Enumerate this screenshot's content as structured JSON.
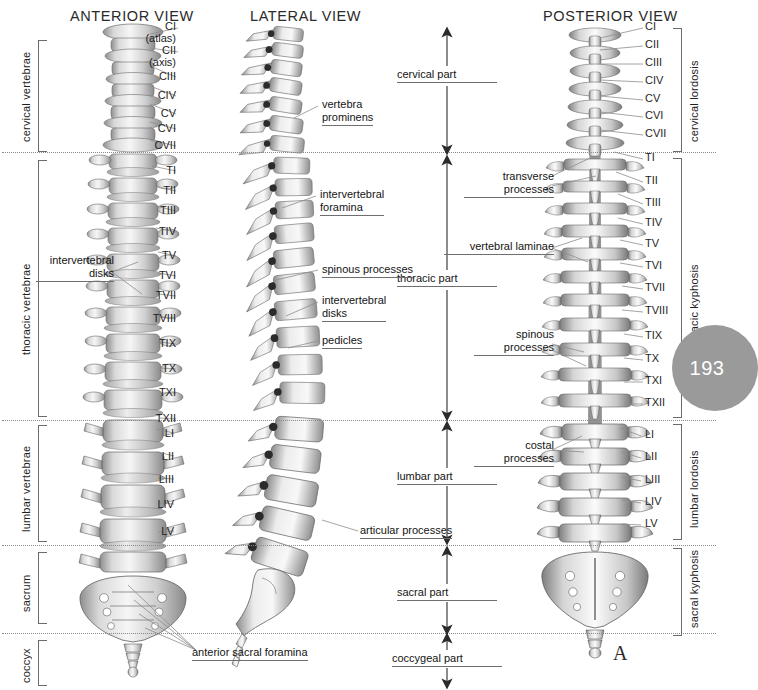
{
  "figure": {
    "figure_label": "A",
    "page_number": "193"
  },
  "headers": [
    {
      "name": "anterior",
      "text": "ANTERIOR VIEW",
      "x": 70,
      "y": 8
    },
    {
      "name": "lateral",
      "text": "LATERAL VIEW",
      "x": 250,
      "y": 8
    },
    {
      "name": "posterior",
      "text": "POSTERIOR VIEW",
      "x": 543,
      "y": 8
    }
  ],
  "left_brackets": [
    {
      "name": "cervical-vertebrae",
      "label": "cervical vertebrae",
      "y": 40,
      "h": 110
    },
    {
      "name": "thoracic-vertebrae",
      "label": "thoracic vertebrae",
      "y": 160,
      "h": 255
    },
    {
      "name": "lumbar-vertebrae",
      "label": "lumbar vertebrae",
      "y": 425,
      "h": 115
    },
    {
      "name": "sacrum",
      "label": "sacrum",
      "y": 552,
      "h": 70
    },
    {
      "name": "coccyx",
      "label": "coccyx",
      "y": 630,
      "h": 52
    }
  ],
  "right_brackets": [
    {
      "name": "cervical-lordosis",
      "label": "cervical lordosis",
      "y": 28,
      "h": 122
    },
    {
      "name": "thoracic-kyphosis",
      "label": "thoracic kyphosis",
      "y": 158,
      "h": 258
    },
    {
      "name": "lumbar-lordosis",
      "label": "lumbar lordosis",
      "y": 424,
      "h": 114
    },
    {
      "name": "sacral-kyphosis",
      "label": "sacral kyphosis",
      "y": 548,
      "h": 86
    }
  ],
  "anterior_labels": [
    {
      "name": "ci",
      "text": "CI",
      "y": 26
    },
    {
      "name": "atlas",
      "text": "(atlas)",
      "y": 38
    },
    {
      "name": "cii",
      "text": "CII",
      "y": 50
    },
    {
      "name": "axis",
      "text": "(axis)",
      "y": 62
    },
    {
      "name": "ciii",
      "text": "CIII",
      "y": 76
    },
    {
      "name": "civ",
      "text": "CIV",
      "y": 95
    },
    {
      "name": "cv",
      "text": "CV",
      "y": 113
    },
    {
      "name": "cvi",
      "text": "CVI",
      "y": 128
    },
    {
      "name": "cvii",
      "text": "CVII",
      "y": 145
    },
    {
      "name": "ti",
      "text": "TI",
      "y": 170
    },
    {
      "name": "tii",
      "text": "TII",
      "y": 190
    },
    {
      "name": "tiii",
      "text": "TIII",
      "y": 210
    },
    {
      "name": "tiv",
      "text": "TIV",
      "y": 231
    },
    {
      "name": "tv",
      "text": "TV",
      "y": 255
    },
    {
      "name": "tvi",
      "text": "TVI",
      "y": 275
    },
    {
      "name": "tvii",
      "text": "TVII",
      "y": 295
    },
    {
      "name": "tviii",
      "text": "TVIII",
      "y": 318
    },
    {
      "name": "tix",
      "text": "TIX",
      "y": 343
    },
    {
      "name": "tx",
      "text": "TX",
      "y": 368
    },
    {
      "name": "txi",
      "text": "TXI",
      "y": 392
    },
    {
      "name": "txii",
      "text": "TXII",
      "y": 418
    },
    {
      "name": "li",
      "text": "LI",
      "y": 432
    },
    {
      "name": "lii",
      "text": "LII",
      "y": 455
    },
    {
      "name": "liii",
      "text": "LIII",
      "y": 478
    },
    {
      "name": "liv",
      "text": "LIV",
      "y": 503
    },
    {
      "name": "lv",
      "text": "LV",
      "y": 530
    }
  ],
  "posterior_labels": [
    {
      "name": "ci",
      "text": "CI",
      "y": 26
    },
    {
      "name": "cii",
      "text": "CII",
      "y": 44
    },
    {
      "name": "ciii",
      "text": "CIII",
      "y": 62
    },
    {
      "name": "civ",
      "text": "CIV",
      "y": 80
    },
    {
      "name": "cv",
      "text": "CV",
      "y": 98
    },
    {
      "name": "cvi",
      "text": "CVI",
      "y": 115
    },
    {
      "name": "cvii",
      "text": "CVII",
      "y": 133
    },
    {
      "name": "ti",
      "text": "TI",
      "y": 157
    },
    {
      "name": "tii",
      "text": "TII",
      "y": 180
    },
    {
      "name": "tiii",
      "text": "TIII",
      "y": 202
    },
    {
      "name": "tiv",
      "text": "TIV",
      "y": 222
    },
    {
      "name": "tv",
      "text": "TV",
      "y": 243
    },
    {
      "name": "tvi",
      "text": "TVI",
      "y": 265
    },
    {
      "name": "tvii",
      "text": "TVII",
      "y": 287
    },
    {
      "name": "tviii",
      "text": "TVIII",
      "y": 310
    },
    {
      "name": "tix",
      "text": "TIX",
      "y": 335
    },
    {
      "name": "tx",
      "text": "TX",
      "y": 358
    },
    {
      "name": "txi",
      "text": "TXI",
      "y": 380
    },
    {
      "name": "txii",
      "text": "TXII",
      "y": 402
    },
    {
      "name": "li",
      "text": "LI",
      "y": 434
    },
    {
      "name": "lii",
      "text": "LII",
      "y": 456
    },
    {
      "name": "liii",
      "text": "LIII",
      "y": 479
    },
    {
      "name": "liv",
      "text": "LIV",
      "y": 501
    },
    {
      "name": "lv",
      "text": "LV",
      "y": 523
    }
  ],
  "column_parts": [
    {
      "name": "cervical-part",
      "text": "cervical part",
      "y": 73,
      "arrow_top": 30,
      "arrow_bot": 150
    },
    {
      "name": "thoracic-part",
      "text": "thoracic part",
      "y": 278,
      "arrow_top": 158,
      "arrow_bot": 417
    },
    {
      "name": "lumbar-part",
      "text": "lumbar part",
      "y": 476,
      "arrow_top": 424,
      "arrow_bot": 541
    },
    {
      "name": "sacral-part",
      "text": "sacral part",
      "y": 592,
      "arrow_top": 549,
      "arrow_bot": 630
    },
    {
      "name": "coccygeal-part",
      "text": "coccygeal part",
      "y": 657,
      "arrow_top": 637,
      "arrow_bot": 681
    }
  ],
  "callouts": [
    {
      "name": "vertebra-prominens",
      "lines": [
        "vertebra",
        "prominens"
      ],
      "x": 322,
      "y": 100,
      "align": "left"
    },
    {
      "name": "intervertebral-foramina",
      "lines": [
        "intervertebral",
        "foramina"
      ],
      "x": 320,
      "y": 190,
      "align": "left"
    },
    {
      "name": "spinous-processes-lat",
      "lines": [
        "spinous processes"
      ],
      "x": 322,
      "y": 264,
      "align": "left"
    },
    {
      "name": "intervertebral-disks-lat",
      "lines": [
        "intervertebral",
        "disks"
      ],
      "x": 322,
      "y": 295,
      "align": "left"
    },
    {
      "name": "pedicles",
      "lines": [
        "pedicles"
      ],
      "x": 322,
      "y": 335,
      "align": "left"
    },
    {
      "name": "intervertebral-disks-ant",
      "lines": [
        "intervertebral",
        "disks"
      ],
      "x": 40,
      "y": 256,
      "align": "left"
    },
    {
      "name": "articular-processes",
      "lines": [
        "articular processes"
      ],
      "x": 360,
      "y": 525,
      "align": "left"
    },
    {
      "name": "anterior-sacral-foramina",
      "lines": [
        "anterior sacral foramina"
      ],
      "x": 192,
      "y": 648,
      "align": "left"
    },
    {
      "name": "transverse-processes",
      "lines": [
        "transverse",
        "processes"
      ],
      "x": 554,
      "y": 172,
      "align": "right"
    },
    {
      "name": "vertebral-laminae",
      "lines": [
        "vertebral laminae"
      ],
      "x": 554,
      "y": 241,
      "align": "right"
    },
    {
      "name": "spinous-processes-post",
      "lines": [
        "spinous",
        "processes"
      ],
      "x": 554,
      "y": 330,
      "align": "right"
    },
    {
      "name": "costal-processes",
      "lines": [
        "costal",
        "processes"
      ],
      "x": 554,
      "y": 441,
      "align": "right"
    }
  ],
  "divider_lines": [
    {
      "name": "cervico-thoracic",
      "y": 152
    },
    {
      "name": "thoraco-lumbar",
      "y": 420
    },
    {
      "name": "lumbo-sacral",
      "y": 545
    },
    {
      "name": "sacro-coccygeal",
      "y": 633
    }
  ]
}
